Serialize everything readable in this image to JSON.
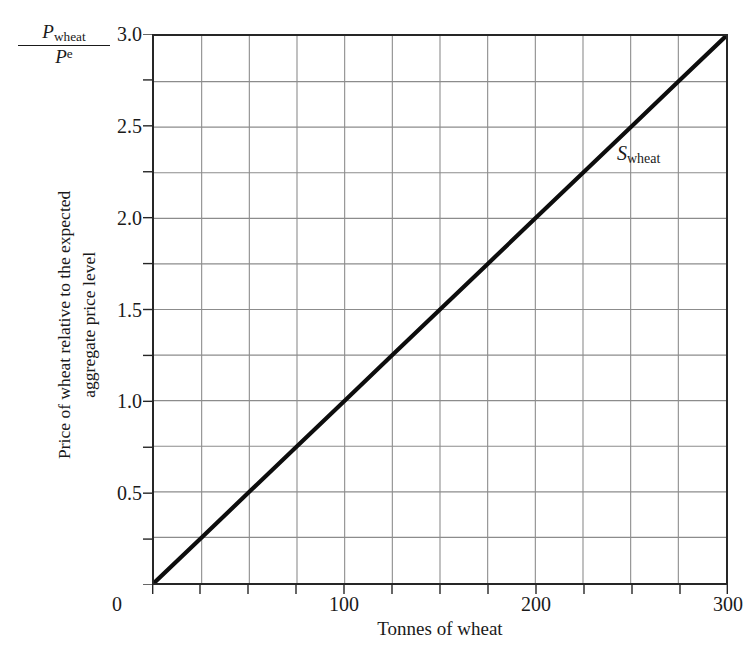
{
  "chart_data": {
    "type": "line",
    "title": "",
    "subtitle": "",
    "xlabel": "Tonnes of wheat",
    "ylabel": "Price of wheat relative to the expected\naggregate price level",
    "ylabel_line1": "Price of wheat relative to the expected",
    "ylabel_line2": "aggregate price level",
    "y_axis_symbol": {
      "numerator_base": "P",
      "numerator_sub": "wheat",
      "denominator_base": "P",
      "denominator_sup": "e"
    },
    "xlim": [
      0,
      300
    ],
    "ylim": [
      0,
      3.0
    ],
    "x_tick_labels": [
      "0",
      "100",
      "200",
      "300"
    ],
    "x_tick_values": [
      0,
      100,
      200,
      300
    ],
    "y_tick_labels": [
      "0",
      "0.5",
      "1.0",
      "1.5",
      "2.0",
      "2.5",
      "3.0"
    ],
    "y_tick_values": [
      0,
      0.5,
      1.0,
      1.5,
      2.0,
      2.5,
      3.0
    ],
    "grid": true,
    "grid_x_step": 25,
    "grid_y_step": 0.25,
    "grid_color": "#8c8c8c",
    "axis_color": "#262626",
    "legend_position": "inline-annotation",
    "series": [
      {
        "name": "S_wheat",
        "label_base": "S",
        "label_sub": "wheat",
        "label_x": 250,
        "label_y": 2.33,
        "color": "#0d0d0d",
        "line_width": 4.2,
        "x": [
          0,
          25,
          50,
          75,
          100,
          125,
          150,
          175,
          200,
          225,
          250,
          275,
          300
        ],
        "values": [
          0,
          0.25,
          0.5,
          0.75,
          1.0,
          1.25,
          1.5,
          1.75,
          2.0,
          2.25,
          2.5,
          2.75,
          3.0
        ]
      }
    ],
    "annotations": [
      {
        "text": "S_wheat",
        "x": 250,
        "y": 2.33
      }
    ]
  }
}
